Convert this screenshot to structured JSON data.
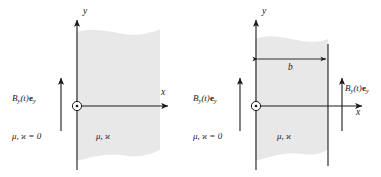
{
  "figure": {
    "name": "magnetic-field-halfspace-and-slab",
    "background_color": "#ffffff",
    "line_color": "#1a1a1a",
    "region_fill_color": "#e8e8e8",
    "region_edge_color": "#7d7d7d"
  },
  "panels": [
    {
      "id": "left",
      "name": "half-space-panel",
      "axes": {
        "y_label": "y",
        "x_label": "x",
        "origin_symbol": "circle-dot"
      },
      "field_label": {
        "base": "B",
        "subscript": "y",
        "argument": "(t)",
        "vector": "e",
        "vector_subscript": "y",
        "full": "B_y(t)e_y"
      },
      "outside_material": {
        "mu": "μ",
        "kappa": "ϰ",
        "value": "= 0",
        "full": "μ, ϰ = 0"
      },
      "inside_material": {
        "mu": "μ",
        "kappa": "ϰ",
        "full": "μ, ϰ"
      }
    },
    {
      "id": "right",
      "name": "slab-panel",
      "axes": {
        "y_label": "y",
        "x_label": "x",
        "origin_symbol": "circle-dot"
      },
      "thickness_label": "b",
      "field_label_left": {
        "base": "B",
        "subscript": "y",
        "argument": "(t)",
        "vector": "e",
        "vector_subscript": "y",
        "full": "B_y(t)e_y"
      },
      "field_label_right": {
        "base": "B",
        "subscript": "y",
        "argument": "(t)",
        "vector": "e",
        "vector_subscript": "y",
        "full": "B_y(t)e_y"
      },
      "outside_material": {
        "mu": "μ",
        "kappa": "ϰ",
        "value": "= 0",
        "full": "μ, ϰ = 0"
      },
      "inside_material": {
        "mu": "μ",
        "kappa": "ϰ",
        "full": "μ, ϰ"
      }
    }
  ]
}
